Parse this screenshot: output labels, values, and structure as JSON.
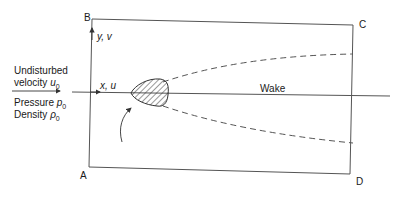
{
  "diagram": {
    "type": "control-volume-flow-past-body",
    "corners": {
      "a": "A",
      "b": "B",
      "c": "C",
      "d": "D"
    },
    "freestream": {
      "line1": "Undisturbed",
      "line2_text": "velocity ",
      "line2_symbol": "u",
      "line2_sub": "0",
      "pressure_text": "Pressure ",
      "pressure_symbol": "p",
      "pressure_sub": "0",
      "density_text": "Density ",
      "density_symbol": "ρ",
      "density_sub": "0"
    },
    "axes": {
      "x_label": "x, u",
      "y_label": "y, v"
    },
    "wake_label": "Wake",
    "colors": {
      "line": "#555555",
      "text": "#1a1a1a",
      "hatch": "#333333"
    }
  }
}
